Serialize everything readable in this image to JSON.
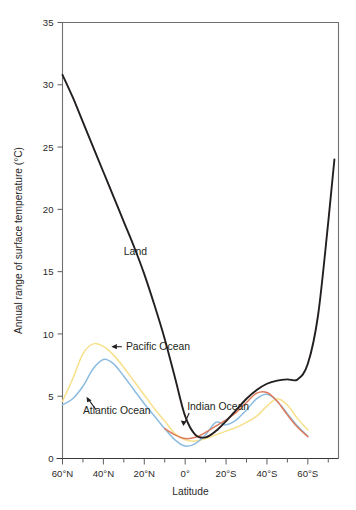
{
  "chart_data": {
    "type": "line",
    "title": "",
    "xlabel": "Latitude",
    "ylabel": "Annual range of surface temperature (°C)",
    "xlim": [
      60,
      -75
    ],
    "ylim": [
      0,
      35
    ],
    "grid": false,
    "legend_position": "inline-annotations",
    "x_tick_labels": [
      "60°N",
      "40°N",
      "20°N",
      "0°",
      "20°S",
      "40°S",
      "60°S"
    ],
    "x_tick_values": [
      60,
      40,
      20,
      0,
      -20,
      -40,
      -60
    ],
    "x_minor_tick_values": [
      50,
      30,
      10,
      -10,
      -30,
      -50,
      -70
    ],
    "y_tick_labels": [
      "0",
      "5",
      "10",
      "15",
      "20",
      "25",
      "30",
      "35"
    ],
    "y_tick_values": [
      0,
      5,
      10,
      15,
      20,
      25,
      30,
      35
    ],
    "series": [
      {
        "name": "Land",
        "color": "#231f20",
        "x": [
          60,
          55,
          50,
          45,
          40,
          35,
          30,
          25,
          20,
          15,
          10,
          5,
          0,
          -5,
          -10,
          -15,
          -20,
          -25,
          -30,
          -35,
          -40,
          -45,
          -50,
          -55,
          -60,
          -65,
          -70,
          -73
        ],
        "values": [
          30.8,
          29.0,
          27.0,
          25.0,
          23.0,
          21.0,
          19.0,
          17.0,
          14.8,
          12.3,
          9.6,
          6.5,
          3.4,
          1.9,
          1.7,
          2.2,
          3.0,
          3.9,
          4.8,
          5.5,
          6.0,
          6.25,
          6.35,
          6.35,
          7.6,
          11.5,
          19.0,
          24.0
        ]
      },
      {
        "name": "Atlantic Ocean",
        "color": "#8cbce0",
        "x": [
          60,
          55,
          50,
          45,
          40,
          35,
          30,
          25,
          20,
          15,
          10,
          5,
          0,
          -5,
          -10,
          -15,
          -20,
          -25,
          -30,
          -35,
          -40,
          -45,
          -50,
          -55,
          -60
        ],
        "values": [
          4.3,
          4.8,
          5.8,
          7.2,
          7.95,
          7.6,
          6.6,
          5.5,
          4.4,
          3.4,
          2.4,
          1.5,
          1.0,
          1.2,
          1.9,
          2.9,
          2.7,
          3.1,
          3.9,
          4.8,
          5.15,
          4.6,
          3.6,
          2.6,
          1.8
        ]
      },
      {
        "name": "Pacific Ocean",
        "color": "#f7e08a",
        "x": [
          60,
          55,
          50,
          45,
          40,
          35,
          30,
          25,
          20,
          15,
          10,
          5,
          0,
          -5,
          -10,
          -15,
          -20,
          -25,
          -30,
          -35,
          -40,
          -45,
          -50,
          -55,
          -60
        ],
        "values": [
          4.6,
          6.4,
          8.4,
          9.2,
          9.0,
          8.3,
          7.3,
          6.2,
          5.1,
          4.0,
          3.0,
          2.0,
          1.5,
          1.4,
          1.6,
          1.9,
          2.2,
          2.5,
          2.9,
          3.4,
          4.2,
          4.8,
          4.3,
          3.2,
          2.3
        ]
      },
      {
        "name": "Indian Ocean",
        "color": "#dd7b5c",
        "x": [
          10,
          5,
          0,
          -5,
          -10,
          -15,
          -20,
          -25,
          -30,
          -35,
          -40,
          -45,
          -50,
          -55,
          -60
        ],
        "values": [
          2.4,
          1.9,
          1.6,
          1.7,
          2.1,
          2.6,
          3.1,
          3.7,
          4.5,
          5.25,
          5.3,
          4.6,
          3.5,
          2.5,
          1.75
        ]
      }
    ],
    "annotations": [
      {
        "label": "Land",
        "x": 30,
        "y": 16.3,
        "has_arrow": false
      },
      {
        "label": "Pacific Ocean",
        "x": 29,
        "y": 8.7,
        "has_arrow": true,
        "arrow_direction": "left"
      },
      {
        "label": "Atlantic Ocean",
        "x": 50,
        "y": 3.6,
        "has_arrow": true,
        "arrow_direction": "up-left"
      },
      {
        "label": "Indian Ocean",
        "x": -1,
        "y": 3.9,
        "has_arrow": true,
        "arrow_direction": "down-left"
      }
    ]
  }
}
